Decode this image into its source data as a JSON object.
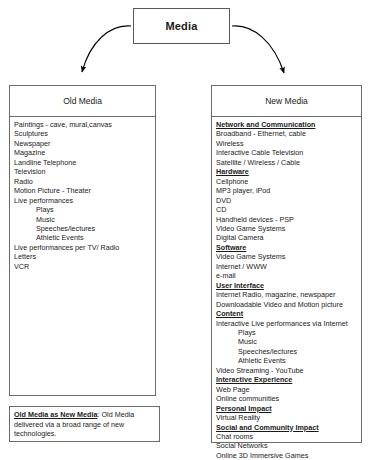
{
  "diagram": {
    "root": {
      "title": "Media"
    },
    "connectors": [
      {
        "name": "arrow-to-old-media",
        "from": "Media",
        "to": "Old Media"
      },
      {
        "name": "arrow-to-new-media",
        "from": "Media",
        "to": "New Media"
      }
    ],
    "columns": [
      {
        "id": "old-media",
        "header": "Old Media",
        "entries": [
          {
            "text": "Paintings - cave, mural,canvas",
            "style": "item"
          },
          {
            "text": "Sculptures",
            "style": "item"
          },
          {
            "text": "Newspaper",
            "style": "item"
          },
          {
            "text": "Magazine",
            "style": "item"
          },
          {
            "text": "Landline Telephone",
            "style": "item"
          },
          {
            "text": "Television",
            "style": "item"
          },
          {
            "text": "Radio",
            "style": "item"
          },
          {
            "text": "Motion Picture - Theater",
            "style": "item"
          },
          {
            "text": "Live performances",
            "style": "item"
          },
          {
            "text": "Plays",
            "style": "sub"
          },
          {
            "text": "Music",
            "style": "sub"
          },
          {
            "text": "Speeches/lectures",
            "style": "sub"
          },
          {
            "text": "Athletic Events",
            "style": "sub"
          },
          {
            "text": "Live performances per TV/ Radio",
            "style": "item"
          },
          {
            "text": "Letters",
            "style": "item"
          },
          {
            "text": "VCR",
            "style": "item"
          }
        ]
      },
      {
        "id": "new-media",
        "header": "New Media",
        "entries": [
          {
            "text": "Network and Communication",
            "style": "heading"
          },
          {
            "text": "Broadband - Ethernet, cable",
            "style": "item"
          },
          {
            "text": "Wireless",
            "style": "item"
          },
          {
            "text": "Interactive Cable Television",
            "style": "item"
          },
          {
            "text": "Satellite / Wireless / Cable",
            "style": "item"
          },
          {
            "text": "Hardware",
            "style": "heading"
          },
          {
            "text": "Cellphone",
            "style": "item"
          },
          {
            "text": "MP3 player, iPod",
            "style": "item"
          },
          {
            "text": "DVD",
            "style": "item"
          },
          {
            "text": "CD",
            "style": "item"
          },
          {
            "text": "Handheld devices - PSP",
            "style": "item"
          },
          {
            "text": "Video Game Systems",
            "style": "item"
          },
          {
            "text": "Digital Camera",
            "style": "item"
          },
          {
            "text": "Software",
            "style": "heading"
          },
          {
            "text": "Video Game Systems",
            "style": "item"
          },
          {
            "text": "Internet / WWW",
            "style": "item"
          },
          {
            "text": "e-mail",
            "style": "item"
          },
          {
            "text": "User Interface",
            "style": "heading"
          },
          {
            "text": "Internet Radio, magazine, newspaper",
            "style": "item"
          },
          {
            "text": "Downloadable Video and Motion picture",
            "style": "item"
          },
          {
            "text": "Content",
            "style": "heading"
          },
          {
            "text": "Interactive Live performances via Internet",
            "style": "item"
          },
          {
            "text": "Plays",
            "style": "sub"
          },
          {
            "text": "Music",
            "style": "sub"
          },
          {
            "text": "Speeches/lectures",
            "style": "sub"
          },
          {
            "text": "Athletic Events",
            "style": "sub"
          },
          {
            "text": "Video Streaming - YouTube",
            "style": "item"
          },
          {
            "text": "Interactive Experience",
            "style": "heading"
          },
          {
            "text": "Web Page",
            "style": "item"
          },
          {
            "text": "Online communities",
            "style": "item"
          },
          {
            "text": "Personal Impact",
            "style": "heading"
          },
          {
            "text": "Virtual Reality",
            "style": "item"
          },
          {
            "text": "Social and Community Impact",
            "style": "heading"
          },
          {
            "text": "Chat rooms",
            "style": "item"
          },
          {
            "text": "Social Networks",
            "style": "item"
          },
          {
            "text": "Online 3D Immersive Games",
            "style": "item"
          }
        ]
      }
    ],
    "note": {
      "label": "Old Media as New Media",
      "body": ": Old Media delivered via a broad range of new technologies."
    },
    "colors": {
      "background": "#ffffff",
      "border": "#6b6b6b",
      "root_border": "#5a5a5a",
      "text": "#1a1a1a",
      "arrow": "#000000"
    }
  }
}
